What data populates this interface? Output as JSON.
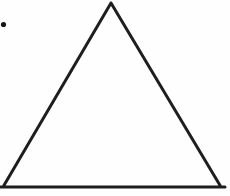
{
  "canvas": {
    "width": 230,
    "height": 196,
    "background_color": "#fefefe"
  },
  "figure": {
    "type": "triangle-outline",
    "stroke_color": "#1e1e1e",
    "stroke_width": 3,
    "fill": "none",
    "vertices": {
      "apex": [
        111,
        3
      ],
      "bottom_left": [
        3,
        187
      ],
      "bottom_right": [
        221,
        187
      ]
    },
    "baseline": {
      "x1": 0,
      "x2": 225,
      "y": 187
    }
  },
  "marks": {
    "list_dot": {
      "cx": 3.5,
      "cy": 24.5,
      "r": 2.6,
      "color": "#161616"
    }
  }
}
